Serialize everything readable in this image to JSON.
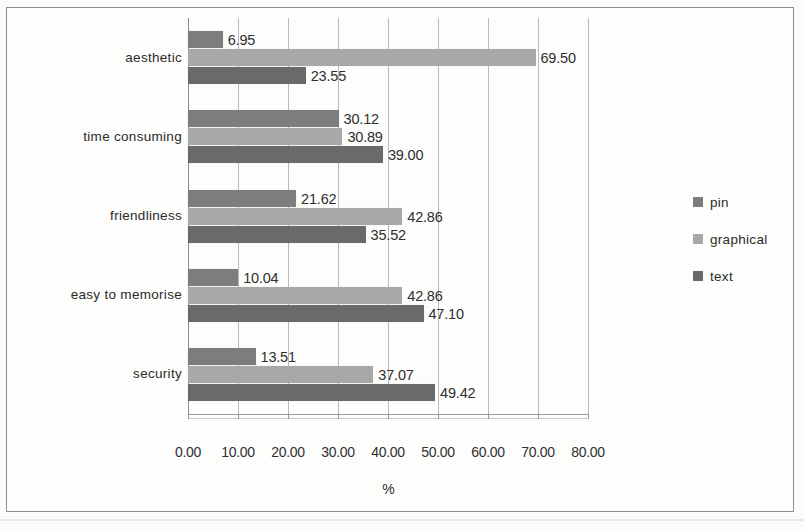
{
  "figure": {
    "background_color": "#fdfdfc",
    "frame_color": "#8e8e8e"
  },
  "chart_data": {
    "type": "bar",
    "orientation": "horizontal",
    "title": "",
    "subtitle": "",
    "xlabel": "%",
    "ylabel": "",
    "xlim": [
      0,
      80
    ],
    "xtick_labels": [
      "0.00",
      "10.00",
      "20.00",
      "30.00",
      "40.00",
      "50.00",
      "60.00",
      "70.00",
      "80.00"
    ],
    "xticks": [
      0,
      10,
      20,
      30,
      40,
      50,
      60,
      70,
      80
    ],
    "grid": "vertical",
    "legend_position": "right",
    "categories": [
      "aesthetic",
      "time consuming",
      "friendliness",
      "easy to memorise",
      "security"
    ],
    "series": [
      {
        "name": "pin",
        "color": "#7d7d7d",
        "values": [
          6.95,
          30.12,
          21.62,
          10.04,
          13.51
        ],
        "labels": [
          "6.95",
          "30.12",
          "21.62",
          "10.04",
          "13.51"
        ]
      },
      {
        "name": "graphical",
        "color": "#a8a8a8",
        "values": [
          69.5,
          30.89,
          42.86,
          42.86,
          37.07
        ],
        "labels": [
          "69.50",
          "30.89",
          "42.86",
          "42.86",
          "37.07"
        ]
      },
      {
        "name": "text",
        "color": "#6a6a6a",
        "values": [
          23.55,
          39.0,
          35.52,
          47.1,
          49.42
        ],
        "labels": [
          "23.55",
          "39.00",
          "35.52",
          "47.10",
          "49.42"
        ]
      }
    ]
  },
  "legend": {
    "items": [
      {
        "label": "pin",
        "color": "#7d7d7d"
      },
      {
        "label": "graphical",
        "color": "#a8a8a8"
      },
      {
        "label": "text",
        "color": "#6a6a6a"
      }
    ]
  },
  "axis": {
    "x_title": "%"
  }
}
